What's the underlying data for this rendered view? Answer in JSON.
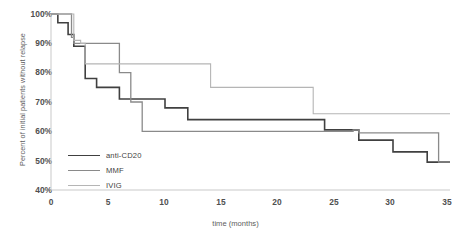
{
  "chart_data": {
    "type": "line",
    "title": "",
    "xlabel": "time (months)",
    "ylabel": "Percent of initial patients without relapse",
    "xlim": [
      0,
      35
    ],
    "ylim": [
      40,
      100
    ],
    "xticks": [
      "0",
      "5",
      "10",
      "15",
      "20",
      "25",
      "30",
      "35"
    ],
    "xtick_values": [
      0,
      5,
      10,
      15,
      20,
      25,
      30,
      35
    ],
    "yticks": [
      "40%",
      "50%",
      "60%",
      "70%",
      "80%",
      "90%",
      "100%"
    ],
    "ytick_values": [
      40,
      50,
      60,
      70,
      80,
      90,
      100
    ],
    "grid": false,
    "legend_position": "inside-lower-left",
    "step_style": "post",
    "series": [
      {
        "name": "anti-CD20",
        "color": "#404040",
        "width": 1.6,
        "points": [
          [
            0,
            100
          ],
          [
            0.6,
            100
          ],
          [
            0.6,
            97
          ],
          [
            1.5,
            97
          ],
          [
            1.5,
            93
          ],
          [
            2,
            93
          ],
          [
            2,
            89
          ],
          [
            3,
            89
          ],
          [
            3,
            78
          ],
          [
            4,
            78
          ],
          [
            4,
            75
          ],
          [
            6,
            75
          ],
          [
            6,
            71
          ],
          [
            10,
            71
          ],
          [
            10,
            68
          ],
          [
            12,
            68
          ],
          [
            12,
            64
          ],
          [
            24,
            64
          ],
          [
            24,
            60.5
          ],
          [
            27,
            60.5
          ],
          [
            27,
            57
          ],
          [
            30,
            57
          ],
          [
            30,
            53
          ],
          [
            33,
            53
          ],
          [
            33,
            49.5
          ],
          [
            35,
            49.5
          ]
        ]
      },
      {
        "name": "MMF",
        "color": "#8a8a8a",
        "width": 1.3,
        "points": [
          [
            0,
            100
          ],
          [
            1.8,
            100
          ],
          [
            1.8,
            92
          ],
          [
            2,
            92
          ],
          [
            2,
            90
          ],
          [
            6,
            90
          ],
          [
            6,
            80
          ],
          [
            7,
            80
          ],
          [
            7,
            70
          ],
          [
            8,
            70
          ],
          [
            8,
            60
          ],
          [
            26.5,
            60
          ],
          [
            26.5,
            60.5
          ],
          [
            27,
            60.5
          ],
          [
            27,
            59.5
          ],
          [
            34,
            59.5
          ],
          [
            34,
            49.5
          ],
          [
            35,
            49.5
          ]
        ]
      },
      {
        "name": "IVIG",
        "color": "#b5b5b5",
        "width": 1.1,
        "points": [
          [
            0,
            100
          ],
          [
            2,
            100
          ],
          [
            2,
            91
          ],
          [
            2.6,
            91
          ],
          [
            2.6,
            90
          ],
          [
            3,
            90
          ],
          [
            3,
            83
          ],
          [
            14,
            83
          ],
          [
            14,
            75
          ],
          [
            23,
            75
          ],
          [
            23,
            66
          ],
          [
            35,
            66
          ]
        ]
      }
    ]
  },
  "legend": {
    "items": [
      {
        "label": "anti-CD20"
      },
      {
        "label": "MMF"
      },
      {
        "label": "IVIG"
      }
    ]
  },
  "axis": {
    "axis_color": "#c9c9c9"
  }
}
